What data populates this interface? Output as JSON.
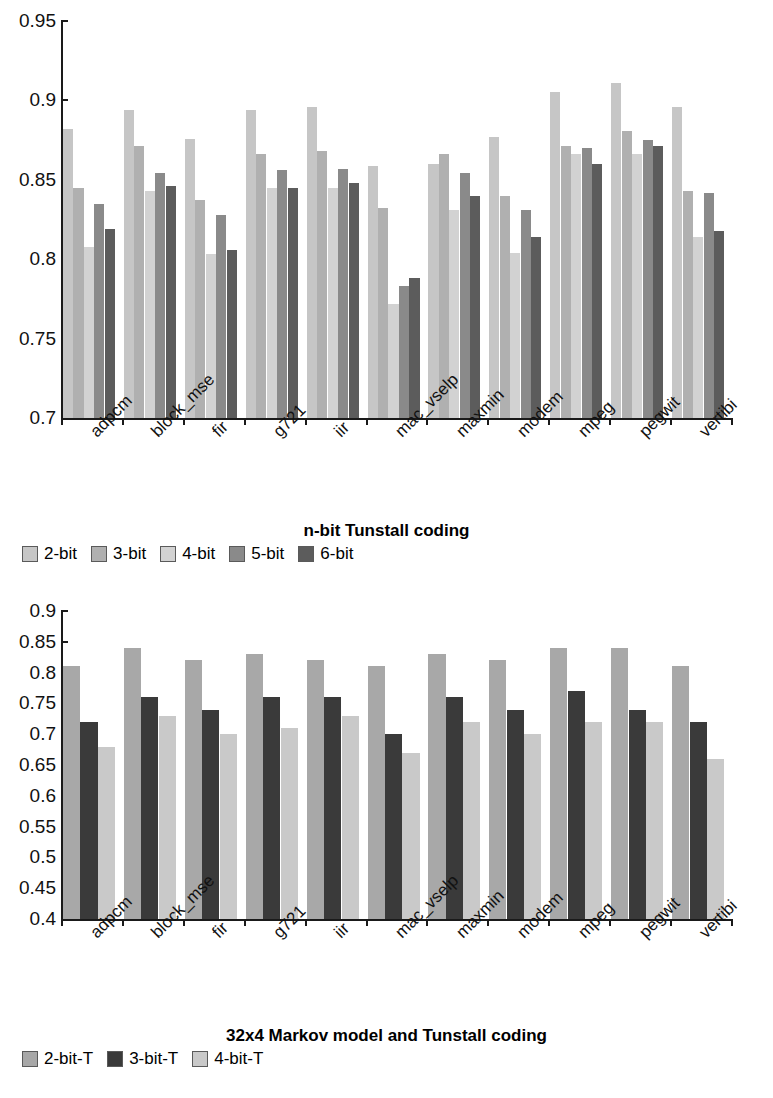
{
  "chart_data": [
    {
      "type": "bar",
      "title": "n-bit Tunstall coding",
      "xlabel": "",
      "ylabel": "",
      "ylim": [
        0.7,
        0.95
      ],
      "yticks": [
        "0.95",
        "0.9",
        "0.85",
        "0.8",
        "0.75",
        "0.7"
      ],
      "grid": false,
      "legend_position": "bottom",
      "categories": [
        "adpcm",
        "block_mse",
        "fir",
        "g721",
        "iir",
        "mac_vselp",
        "maxmin",
        "modem",
        "mpeg",
        "pegwit",
        "vertibi"
      ],
      "series": [
        {
          "name": "2-bit",
          "color": "#c6c6c6",
          "values": [
            0.882,
            0.894,
            0.876,
            0.894,
            0.896,
            0.859,
            0.86,
            0.877,
            0.905,
            0.911,
            0.896
          ]
        },
        {
          "name": "3-bit",
          "color": "#b0b0b0",
          "values": [
            0.845,
            0.871,
            0.837,
            0.866,
            0.868,
            0.832,
            0.866,
            0.84,
            0.871,
            0.881,
            0.843
          ]
        },
        {
          "name": "4-bit",
          "color": "#d2d2d2",
          "values": [
            0.808,
            0.843,
            0.803,
            0.845,
            0.845,
            0.772,
            0.831,
            0.804,
            0.866,
            0.866,
            0.814
          ]
        },
        {
          "name": "5-bit",
          "color": "#8a8a8a",
          "values": [
            0.835,
            0.854,
            0.828,
            0.856,
            0.857,
            0.783,
            0.854,
            0.831,
            0.87,
            0.875,
            0.842
          ]
        },
        {
          "name": "6-bit",
          "color": "#5c5c5c",
          "values": [
            0.819,
            0.846,
            0.806,
            0.845,
            0.848,
            0.788,
            0.84,
            0.814,
            0.86,
            0.871,
            0.818
          ]
        }
      ]
    },
    {
      "type": "bar",
      "title": "32x4 Markov model and Tunstall coding",
      "xlabel": "",
      "ylabel": "",
      "ylim": [
        0.4,
        0.9
      ],
      "yticks": [
        "0.9",
        "0.85",
        "0.8",
        "0.75",
        "0.7",
        "0.65",
        "0.6",
        "0.55",
        "0.5",
        "0.45",
        "0.4"
      ],
      "grid": false,
      "legend_position": "bottom",
      "categories": [
        "adpcm",
        "block_mse",
        "fir",
        "g721",
        "iir",
        "mac_vselp",
        "maxmin",
        "modem",
        "mpeg",
        "pegwit",
        "vertibi"
      ],
      "series": [
        {
          "name": "2-bit-T",
          "color": "#a8a8a8",
          "values": [
            0.81,
            0.84,
            0.82,
            0.83,
            0.82,
            0.81,
            0.83,
            0.82,
            0.84,
            0.84,
            0.81
          ]
        },
        {
          "name": "3-bit-T",
          "color": "#3a3a3a",
          "values": [
            0.72,
            0.76,
            0.74,
            0.76,
            0.76,
            0.7,
            0.76,
            0.74,
            0.77,
            0.74,
            0.72
          ]
        },
        {
          "name": "4-bit-T",
          "color": "#c9c9c9",
          "values": [
            0.68,
            0.73,
            0.7,
            0.71,
            0.73,
            0.67,
            0.72,
            0.7,
            0.72,
            0.72,
            0.66
          ]
        }
      ]
    }
  ]
}
